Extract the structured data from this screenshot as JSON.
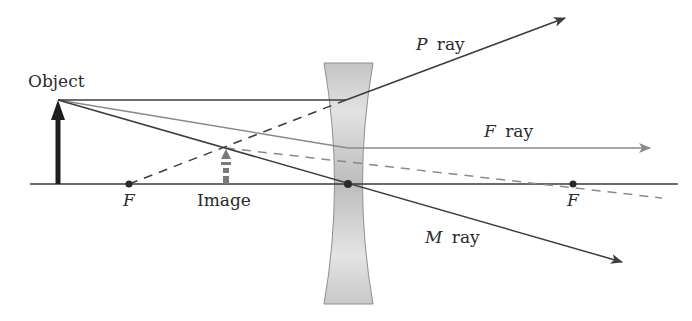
{
  "diagram": {
    "labels": {
      "object": "Object",
      "image": "Image",
      "focal_left": "F",
      "focal_right": "F",
      "p_ray_letter": "P",
      "f_ray_letter": "F",
      "m_ray_letter": "M",
      "ray_word": "ray"
    },
    "colors": {
      "axis": "#3a3a3a",
      "object_arrow": "#1e1e1e",
      "ray_dark": "#3d3d3d",
      "ray_gray": "#8a8a8a",
      "lens_fill": "#c9c9c9",
      "lens_edge": "#8f8f8f"
    },
    "geometry": {
      "axis_y": 184,
      "object_x": 58,
      "object_top_y": 100,
      "lens_center_x": 348,
      "focal_left_x": 129,
      "focal_right_x": 573,
      "image_x": 226,
      "image_top_y": 148
    }
  }
}
